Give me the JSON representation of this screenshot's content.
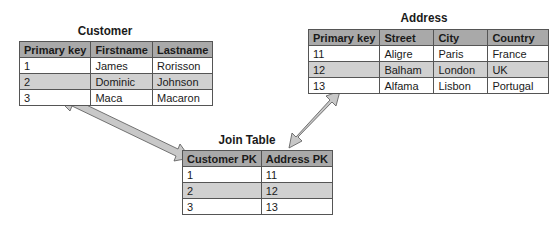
{
  "customer": {
    "title": "Customer",
    "headers": [
      "Primary key",
      "Firstname",
      "Lastname"
    ],
    "rows": [
      [
        "1",
        "James",
        "Rorisson"
      ],
      [
        "2",
        "Dominic",
        "Johnson"
      ],
      [
        "3",
        "Maca",
        "Macaron"
      ]
    ]
  },
  "address": {
    "title": "Address",
    "headers": [
      "Primary key",
      "Street",
      "City",
      "Country"
    ],
    "rows": [
      [
        "11",
        "Aligre",
        "Paris",
        "France"
      ],
      [
        "12",
        "Balham",
        "London",
        "UK"
      ],
      [
        "13",
        "Alfama",
        "Lisbon",
        "Portugal"
      ]
    ]
  },
  "join": {
    "title": "Join Table",
    "headers": [
      "Customer PK",
      "Address PK"
    ],
    "rows": [
      [
        "1",
        "11"
      ],
      [
        "2",
        "12"
      ],
      [
        "3",
        "13"
      ]
    ]
  },
  "colors": {
    "header_bg": "#a9a9a9",
    "alt_row_bg": "#d0d0d0",
    "arrow_fill": "#c8c8c8",
    "border": "#555555"
  }
}
